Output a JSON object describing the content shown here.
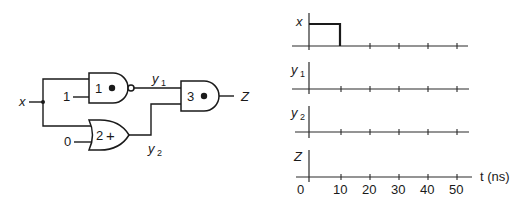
{
  "circuit": {
    "input_label": "x",
    "gates": [
      {
        "id": "1",
        "symbol": "•",
        "type": "NAND",
        "const_input": "1"
      },
      {
        "id": "2",
        "symbol": "+",
        "type": "OR",
        "const_input": "0"
      },
      {
        "id": "3",
        "symbol": "•",
        "type": "AND"
      }
    ],
    "signals": {
      "y1": "y",
      "y1_sub": "1",
      "y2": "y",
      "y2_sub": "2",
      "output": "Z"
    }
  },
  "timing": {
    "rows": [
      {
        "label": "x",
        "sub": ""
      },
      {
        "label": "y",
        "sub": "1"
      },
      {
        "label": "y",
        "sub": "2"
      },
      {
        "label": "Z",
        "sub": ""
      }
    ],
    "ticks": [
      "0",
      "10",
      "20",
      "30",
      "40",
      "50"
    ],
    "axis_label": "t (ns)",
    "x_waveform": "high from 0 to 10 ns, then low"
  }
}
